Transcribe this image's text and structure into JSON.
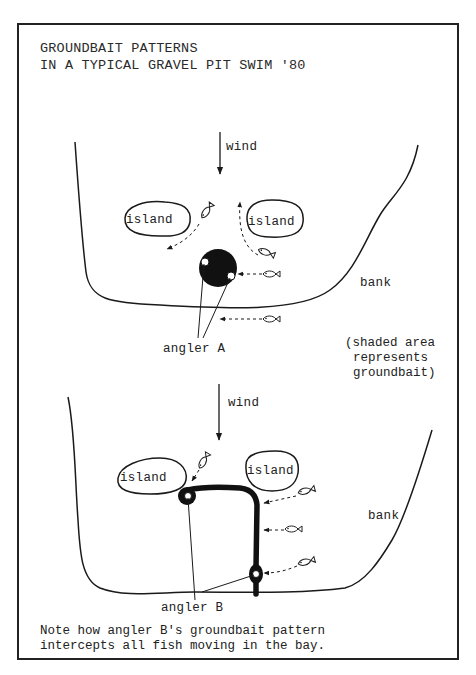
{
  "figure": {
    "title_line1": "GROUNDBAIT PATTERNS",
    "title_line2": "IN A TYPICAL GRAVEL PIT SWIM '80",
    "panel_a": {
      "wind_label": "wind",
      "island_left_label": "island",
      "island_right_label": "island",
      "bank_label": "bank",
      "angler_label": "angler A",
      "legend_line1": "(shaded area",
      "legend_line2": "represents",
      "legend_line3": "groundbait)"
    },
    "panel_b": {
      "wind_label": "wind",
      "island_left_label": "island",
      "island_right_label": "island",
      "bank_label": "bank",
      "angler_label": "angler B"
    },
    "caption_line1": "Note how angler B's groundbait pattern",
    "caption_line2": "intercepts all fish moving in the bay."
  },
  "colors": {
    "ink": "#1a1a1a",
    "groundbait": "#111111",
    "paper": "#ffffff"
  },
  "icons": [
    "wind-arrow-icon",
    "fish-icon",
    "dashed-arrow-icon",
    "groundbait-blob-icon",
    "angler-marker-icon"
  ]
}
